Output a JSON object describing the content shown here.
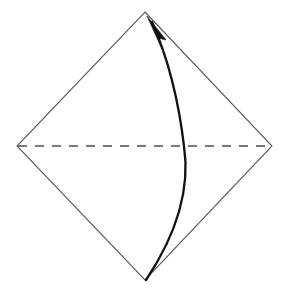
{
  "figure": {
    "type": "origami-fold-diagram",
    "canvas": {
      "width": 285,
      "height": 292,
      "background": "#ffffff"
    },
    "title": "",
    "caption": "",
    "colors": {
      "paper_edge": "#5a5a5a",
      "fold_line": "#4d4d4d",
      "arrow": "#111111",
      "background": "#ffffff"
    },
    "shapes": {
      "paper": {
        "name": "diamond-square",
        "stroke": "#5a5a5a",
        "stroke_width": 1.1,
        "fill": "none",
        "vertices": [
          {
            "label": "top",
            "x": 145,
            "y": 12
          },
          {
            "label": "right",
            "x": 272,
            "y": 146
          },
          {
            "label": "bottom",
            "x": 145,
            "y": 280
          },
          {
            "label": "left",
            "x": 17,
            "y": 146
          }
        ],
        "points": "145,12 272,146 145,280 17,146"
      },
      "fold_line": {
        "name": "horizontal-dashed-fold",
        "style": "dashed",
        "stroke": "#4d4d4d",
        "stroke_width": 1.4,
        "dash_pattern": "9 8",
        "x1": 18,
        "y1": 146,
        "x2": 271,
        "y2": 146
      },
      "curved_arrow": {
        "name": "fold-direction-arrow",
        "stroke": "#111111",
        "stroke_width": 2.3,
        "fill": "none",
        "direction": "bottom-to-top",
        "bulge": "right",
        "path": "M 146,280 C 178,232 190,186 184,146 C 179,104 168,58 152,22",
        "start": {
          "x": 146,
          "y": 280
        },
        "end": {
          "x": 152,
          "y": 22
        },
        "control_hint": {
          "max_bulge_x": 185,
          "at_y": 150
        }
      },
      "arrow_head": {
        "name": "solid-arrowhead",
        "fill": "#111111",
        "stroke": "#111111",
        "stroke_width": 0.6,
        "tip": {
          "x": 147,
          "y": 16
        },
        "points": "147,16 166,40 158,38 161,47"
      }
    }
  }
}
